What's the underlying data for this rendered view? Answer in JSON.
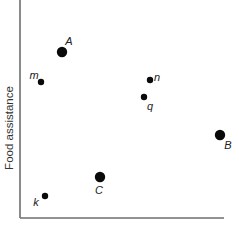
{
  "chart_data": {
    "type": "scatter",
    "title": "",
    "xlabel": "",
    "ylabel": "Food assistance",
    "grid": false,
    "legend": null,
    "ticks": {
      "x": [],
      "y": []
    },
    "points": [
      {
        "label": "A",
        "x": 62,
        "y": 52,
        "size": "large",
        "label_dx": 7,
        "label_dy": -10
      },
      {
        "label": "m",
        "x": 41,
        "y": 82,
        "size": "small",
        "label_dx": -7,
        "label_dy": -6
      },
      {
        "label": "n",
        "x": 150,
        "y": 80,
        "size": "small",
        "label_dx": 7,
        "label_dy": -2
      },
      {
        "label": "q",
        "x": 144,
        "y": 97,
        "size": "small",
        "label_dx": 6,
        "label_dy": 10
      },
      {
        "label": "B",
        "x": 220,
        "y": 135,
        "size": "large",
        "label_dx": 8,
        "label_dy": 11
      },
      {
        "label": "C",
        "x": 100,
        "y": 177,
        "size": "large",
        "label_dx": -1,
        "label_dy": 14
      },
      {
        "label": "k",
        "x": 45,
        "y": 196,
        "size": "small",
        "label_dx": -9,
        "label_dy": 7
      }
    ],
    "axes": {
      "origin": [
        20,
        218
      ],
      "x_end": 224,
      "y_top": 0
    }
  },
  "colors": {
    "axis": "#6e6e6e",
    "point": "#0a0a0a",
    "text": "#222222"
  },
  "sizes": {
    "large_radius": 5.2,
    "small_radius": 3.2
  }
}
